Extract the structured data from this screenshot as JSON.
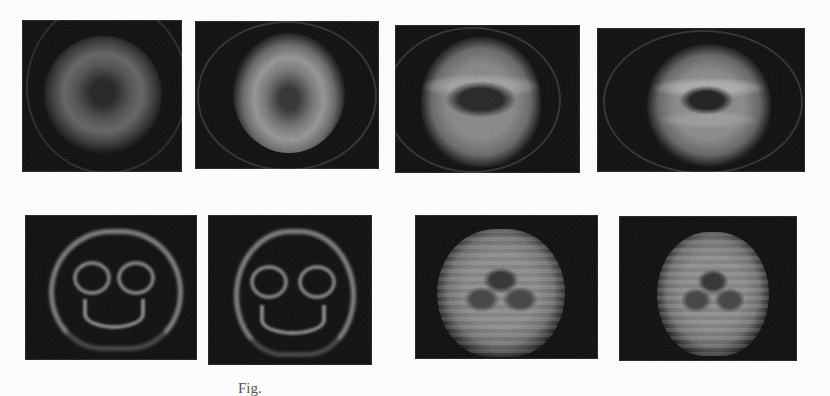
{
  "figure": {
    "caption_visible_fragment": "Fig.",
    "rows": [
      {
        "row": 1,
        "description": "Blurry concentric ring / donut patterns on black background, progressing toward face-like structure",
        "panels": [
          {
            "index": 1,
            "content": "dark-centered gray ring"
          },
          {
            "index": 2,
            "content": "bright gray donut with dark center"
          },
          {
            "index": 3,
            "content": "rounded blob with emerging horizontal bands"
          },
          {
            "index": 4,
            "content": "rounded blob with stronger banding"
          }
        ]
      },
      {
        "row": 2,
        "description": "Skull / face-like reconstructions on black background",
        "panels": [
          {
            "index": 5,
            "content": "outlined skull-like face with eyes and smile"
          },
          {
            "index": 6,
            "content": "outlined skull-like face with eyes and smile (similar)"
          },
          {
            "index": 7,
            "content": "filled skull-like face with horizontal striations"
          },
          {
            "index": 8,
            "content": "filled skull-like face, smoother"
          }
        ]
      }
    ]
  },
  "colors": {
    "page_background": "#fbfbfb",
    "panel_background": "#151515",
    "feature_gray": "#8c8c8c"
  }
}
